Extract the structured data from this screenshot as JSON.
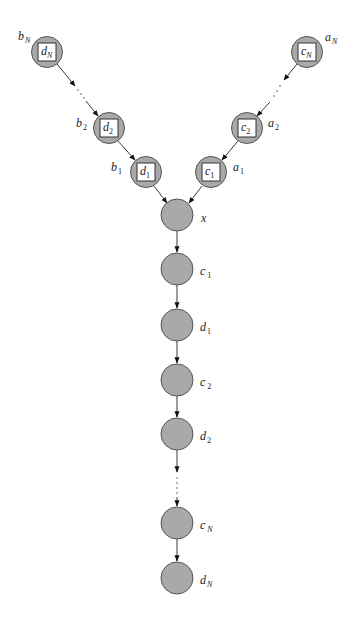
{
  "diagram": {
    "type": "directed-graphical-model",
    "left_chain": [
      {
        "id": "bN",
        "outer_label": "b",
        "outer_sub": "N",
        "inner_label": "d",
        "inner_sub": "N",
        "cx": 47,
        "cy": 52
      },
      {
        "id": "b2",
        "outer_label": "b",
        "outer_sub": "2",
        "inner_label": "d",
        "inner_sub": "2",
        "cx": 109,
        "cy": 128
      },
      {
        "id": "b1",
        "outer_label": "b",
        "outer_sub": "1",
        "inner_label": "d",
        "inner_sub": "1",
        "cx": 146,
        "cy": 172
      }
    ],
    "right_chain": [
      {
        "id": "aN",
        "outer_label": "a",
        "outer_sub": "N",
        "inner_label": "c",
        "inner_sub": "N",
        "cx": 307,
        "cy": 52
      },
      {
        "id": "a2",
        "outer_label": "a",
        "outer_sub": "2",
        "inner_label": "c",
        "inner_sub": "2",
        "cx": 247,
        "cy": 128
      },
      {
        "id": "a1",
        "outer_label": "a",
        "outer_sub": "1",
        "inner_label": "c",
        "inner_sub": "1",
        "cx": 211,
        "cy": 172
      }
    ],
    "center_node": {
      "id": "x",
      "label": "x",
      "cx": 177,
      "cy": 215
    },
    "vertical_chain": [
      {
        "id": "c1",
        "label": "c",
        "sub": "1",
        "cy": 269
      },
      {
        "id": "d1",
        "label": "d",
        "sub": "1",
        "cy": 325
      },
      {
        "id": "c2",
        "label": "c",
        "sub": "2",
        "cy": 380
      },
      {
        "id": "d2",
        "label": "d",
        "sub": "2",
        "cy": 434
      },
      {
        "id": "cN",
        "label": "c",
        "sub": "N",
        "cy": 523
      },
      {
        "id": "dN",
        "label": "d",
        "sub": "N",
        "cy": 578
      }
    ],
    "ellipsis": "· · ·",
    "colors": {
      "node_fill": "#a9a9a9",
      "node_stroke": "#555555",
      "box_fill": "#ffffff",
      "edge": "#222222"
    }
  }
}
